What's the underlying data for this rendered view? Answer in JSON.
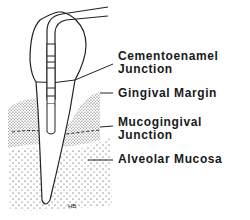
{
  "diagram": {
    "labels": [
      {
        "id": "cej",
        "line1": "Cementoenamel",
        "line2": "Junction"
      },
      {
        "id": "gingival-margin",
        "line1": "Gingival Margin",
        "line2": ""
      },
      {
        "id": "mgj",
        "line1": "Mucogingival",
        "line2": "Junction"
      },
      {
        "id": "alveolar-mucosa",
        "line1": "Alveolar Mucosa",
        "line2": ""
      }
    ],
    "signature": "HB"
  },
  "colors": {
    "ink": "#1a1a1a",
    "background": "#ffffff"
  }
}
